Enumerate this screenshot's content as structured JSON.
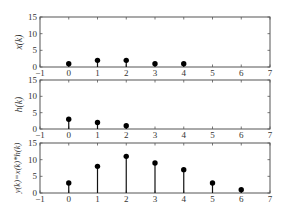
{
  "figure": {
    "width": 282,
    "height": 218,
    "background": "#ffffff",
    "axis_color": "#555555",
    "stem_color": "#111111",
    "marker_color": "#000000"
  },
  "chart_data": [
    {
      "type": "stem",
      "title": "",
      "xlabel": "",
      "ylabel": "x(k)",
      "x": [
        0,
        1,
        2,
        3,
        4
      ],
      "values": [
        1,
        2,
        2,
        1,
        1
      ],
      "xlim": [
        -1,
        7
      ],
      "ylim": [
        0,
        15
      ],
      "xticks": [
        -1,
        0,
        1,
        2,
        3,
        4,
        5,
        6,
        7
      ],
      "yticks": [
        0,
        5,
        10,
        15
      ],
      "grid": false,
      "legend": null
    },
    {
      "type": "stem",
      "title": "",
      "xlabel": "",
      "ylabel": "h(k)",
      "x": [
        0,
        1,
        2
      ],
      "values": [
        3,
        2,
        1
      ],
      "xlim": [
        -1,
        7
      ],
      "ylim": [
        0,
        15
      ],
      "xticks": [
        -1,
        0,
        1,
        2,
        3,
        4,
        5,
        6,
        7
      ],
      "yticks": [
        0,
        5,
        10,
        15
      ],
      "grid": false,
      "legend": null
    },
    {
      "type": "stem",
      "title": "",
      "xlabel": "",
      "ylabel": "y(k)=x(k)*h(k)",
      "x": [
        0,
        1,
        2,
        3,
        4,
        5,
        6
      ],
      "values": [
        3,
        8,
        11,
        9,
        7,
        3,
        1
      ],
      "xlim": [
        -1,
        7
      ],
      "ylim": [
        0,
        15
      ],
      "xticks": [
        -1,
        0,
        1,
        2,
        3,
        4,
        5,
        6,
        7
      ],
      "yticks": [
        0,
        5,
        10,
        15
      ],
      "grid": false,
      "legend": null
    }
  ],
  "layout": {
    "panels": [
      {
        "left": 40,
        "right": 270,
        "top": 17,
        "bottom": 67
      },
      {
        "left": 40,
        "right": 270,
        "top": 80,
        "bottom": 129
      },
      {
        "left": 40,
        "right": 270,
        "top": 143,
        "bottom": 193
      }
    ]
  }
}
